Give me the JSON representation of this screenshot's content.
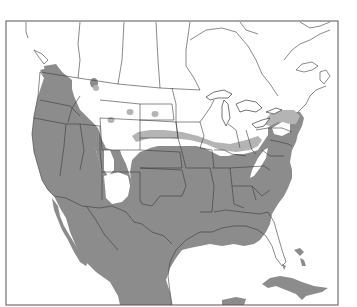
{
  "figure": {
    "type": "range-map",
    "region": "North America (United States, southern Canada, Mexico, Caribbean)",
    "caption_fragment": "",
    "frame": {
      "x": 6,
      "y": 21,
      "width": 332,
      "height": 284,
      "stroke": "#555555"
    },
    "colors": {
      "background": "#ffffff",
      "range_dark": "#8c8c8c",
      "range_light": "#b4b4b4",
      "border_line": "#3a3a3a",
      "water": "#ffffff"
    },
    "legend": []
  }
}
